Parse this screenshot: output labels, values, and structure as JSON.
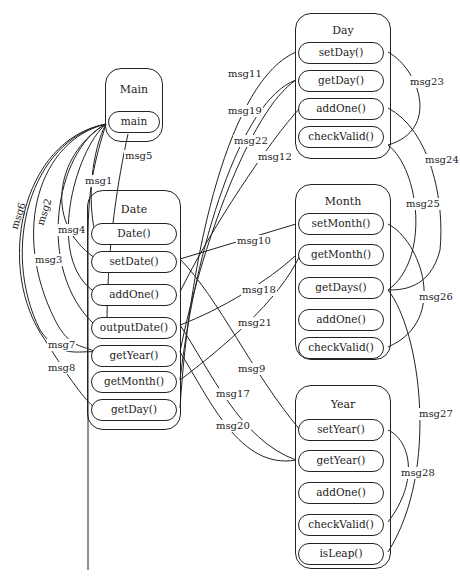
{
  "classes": {
    "main": {
      "title": "Main",
      "methods": [
        "main"
      ]
    },
    "date": {
      "title": "Date",
      "methods": [
        "Date()",
        "setDate()",
        "addOne()",
        "outputDate()",
        "getYear()",
        "getMonth()",
        "getDay()"
      ]
    },
    "day": {
      "title": "Day",
      "methods": [
        "setDay()",
        "getDay()",
        "addOne()",
        "checkValid()"
      ]
    },
    "month": {
      "title": "Month",
      "methods": [
        "setMonth()",
        "getMonth()",
        "getDays()",
        "addOne()",
        "checkValid()"
      ]
    },
    "year": {
      "title": "Year",
      "methods": [
        "setYear()",
        "getYear()",
        "addOne()",
        "checkValid()",
        "isLeap()"
      ]
    }
  },
  "messages": {
    "msg1": "msg1",
    "msg2": "msg2",
    "msg3": "msg3",
    "msg4": "msg4",
    "msg5": "msg5",
    "msg6": "msg6",
    "msg7": "msg7",
    "msg8": "msg8",
    "msg9": "msg9",
    "msg10": "msg10",
    "msg11": "msg11",
    "msg12": "msg12",
    "msg17": "msg17",
    "msg18": "msg18",
    "msg19": "msg19",
    "msg20": "msg20",
    "msg21": "msg21",
    "msg22": "msg22",
    "msg23": "msg23",
    "msg24": "msg24",
    "msg25": "msg25",
    "msg26": "msg26",
    "msg27": "msg27",
    "msg28": "msg28"
  }
}
